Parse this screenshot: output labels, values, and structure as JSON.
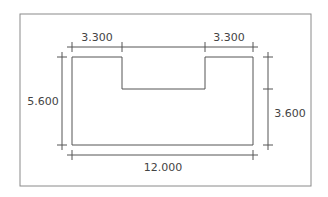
{
  "diagram": {
    "type": "dimensioned-floor-plan",
    "colors": {
      "frame": "#8a8a8a",
      "shape": "#555555",
      "dimension": "#555555",
      "text": "#444444",
      "background": "#ffffff"
    },
    "dimensions": {
      "top_left": {
        "label": "3.300",
        "value": 3.3
      },
      "top_right": {
        "label": "3.300",
        "value": 3.3
      },
      "left": {
        "label": "5.600",
        "value": 5.6
      },
      "right": {
        "label": "3.600",
        "value": 3.6
      },
      "bottom": {
        "label": "12.000",
        "value": 12.0
      }
    }
  }
}
